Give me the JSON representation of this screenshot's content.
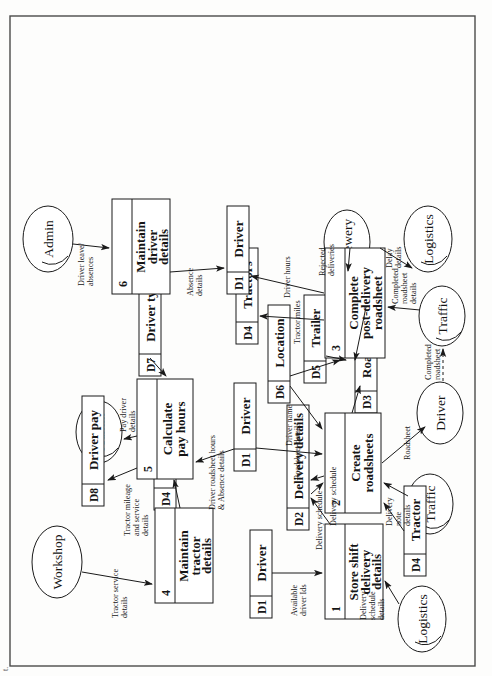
{
  "page": {
    "orientation": "landscape-diagram-rotated-90ccw",
    "margin_caption_line1": "al",
    "margin_caption_line2": "t."
  },
  "diagram": {
    "type": "data-flow-diagram",
    "processes": [
      {
        "id": "1",
        "number": "1",
        "lines": [
          "Store shift",
          "delivery",
          "details"
        ]
      },
      {
        "id": "2",
        "number": "2",
        "lines": [
          "Create",
          "roadsheets"
        ]
      },
      {
        "id": "3",
        "number": "3",
        "lines": [
          "Complete",
          "post-delivery",
          "roadsheet"
        ]
      },
      {
        "id": "4",
        "number": "4",
        "lines": [
          "Maintain",
          "tractor",
          "details"
        ]
      },
      {
        "id": "5",
        "number": "5",
        "lines": [
          "Calculate",
          "pay hours"
        ]
      },
      {
        "id": "6",
        "number": "6",
        "lines": [
          "Maintain",
          "driver",
          "details"
        ]
      }
    ],
    "data_stores": [
      {
        "id": "s_d1_a",
        "code": "D1",
        "label": "Driver"
      },
      {
        "id": "s_d2",
        "code": "D2",
        "label": "Delivery details"
      },
      {
        "id": "s_d1_b",
        "code": "D1",
        "label": "Driver"
      },
      {
        "id": "s_d4_a",
        "code": "D4",
        "label": "Tractor"
      },
      {
        "id": "s_d4_b",
        "code": "D4",
        "label": "Tractor"
      },
      {
        "id": "s_d6",
        "code": "D6",
        "label": "Location"
      },
      {
        "id": "s_d5",
        "code": "D5",
        "label": "Trailer"
      },
      {
        "id": "s_d3",
        "code": "D3",
        "label": "Roadsheet"
      },
      {
        "id": "s_d4_c",
        "code": "D4",
        "label": "Tractors"
      },
      {
        "id": "s_d1_c",
        "code": "D1",
        "label": "Driver"
      },
      {
        "id": "s_d8",
        "code": "D8",
        "label": "Driver pay"
      },
      {
        "id": "s_d7",
        "code": "D7",
        "label": "Driver type"
      }
    ],
    "entities": [
      {
        "id": "e_logistics_1",
        "label": "Logistics"
      },
      {
        "id": "e_traffic_1",
        "label": "Traffic"
      },
      {
        "id": "e_driver_1",
        "label": "Driver"
      },
      {
        "id": "e_traffic_2",
        "label": "Traffic"
      },
      {
        "id": "e_logistics_2",
        "label": "Logistics"
      },
      {
        "id": "e_brewery",
        "label": "Brewery"
      },
      {
        "id": "e_workshop",
        "label": "Workshop"
      },
      {
        "id": "e_admin_1",
        "label": "Admin"
      },
      {
        "id": "e_admin_2",
        "label": "Admin"
      }
    ],
    "flows": [
      {
        "id": "f1",
        "lines": [
          "Delivery",
          "schedule",
          "details"
        ]
      },
      {
        "id": "f2",
        "lines": [
          "Available",
          "driver Ids"
        ]
      },
      {
        "id": "f3",
        "lines": [
          "Delivery schedule"
        ]
      },
      {
        "id": "f4",
        "lines": [
          "Delivery schedule"
        ]
      },
      {
        "id": "f5",
        "lines": [
          "Roadsheet details"
        ]
      },
      {
        "id": "f6",
        "lines": [
          "Driver name"
        ]
      },
      {
        "id": "f7",
        "lines": [
          "Delivery",
          "note",
          "details"
        ]
      },
      {
        "id": "f8",
        "lines": [
          "Roadsheet"
        ]
      },
      {
        "id": "f9",
        "lines": [
          "Completed",
          "roadsheet"
        ]
      },
      {
        "id": "f10",
        "lines": [
          "Completed",
          "roadsheet",
          "details"
        ]
      },
      {
        "id": "f11",
        "lines": [
          "Tractor miles"
        ]
      },
      {
        "id": "f12",
        "lines": [
          "Driver hours"
        ]
      },
      {
        "id": "f13",
        "lines": [
          "Rejected",
          "deliveries"
        ]
      },
      {
        "id": "f14",
        "lines": [
          "Delay",
          "details"
        ]
      },
      {
        "id": "f15",
        "lines": [
          "Tractor service",
          "details"
        ]
      },
      {
        "id": "f16",
        "lines": [
          "Tractor mileage",
          "and service",
          "details"
        ]
      },
      {
        "id": "f17",
        "lines": [
          "Driver roadsheet hours",
          "& Absence details"
        ]
      },
      {
        "id": "f18",
        "lines": [
          "Pay driver",
          "details"
        ]
      },
      {
        "id": "f19",
        "lines": [
          "Driver leave/",
          "absences"
        ]
      },
      {
        "id": "f20",
        "lines": [
          "Absence",
          "details"
        ]
      }
    ]
  }
}
